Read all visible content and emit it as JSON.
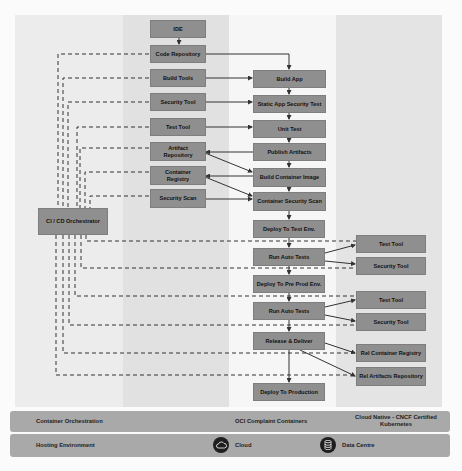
{
  "diagram": {
    "tools_column": [
      {
        "id": "ide",
        "label": "IDE"
      },
      {
        "id": "code-repository",
        "label": "Code Repository"
      },
      {
        "id": "build-tools",
        "label": "Build Tools"
      },
      {
        "id": "security-tool",
        "label": "Security Tool"
      },
      {
        "id": "test-tool",
        "label": "Test Tool"
      },
      {
        "id": "artifact-repository",
        "label": "Artifact Repository"
      },
      {
        "id": "container-registry",
        "label": "Container Registry"
      },
      {
        "id": "security-scan",
        "label": "Security Scan"
      }
    ],
    "orchestrator": {
      "label": "CI / CD Orchestrator"
    },
    "pipeline_steps": [
      {
        "id": "build-app",
        "label": "Build App"
      },
      {
        "id": "static-app-security-test",
        "label": "Static App Security Test"
      },
      {
        "id": "unit-test",
        "label": "Unit Test"
      },
      {
        "id": "publish-artifacts",
        "label": "Publish Artifacts"
      },
      {
        "id": "build-container-image",
        "label": "Build Container Image"
      },
      {
        "id": "container-security-scan",
        "label": "Container Security Scan"
      },
      {
        "id": "deploy-to-test-env",
        "label": "Deploy To Test Env."
      },
      {
        "id": "run-auto-tests-1",
        "label": "Run Auto  Tests"
      },
      {
        "id": "deploy-to-pre-prod-env",
        "label": "Deploy To Pre Prod Env."
      },
      {
        "id": "run-auto-tests-2",
        "label": "Run Auto Tests"
      },
      {
        "id": "release-deliver",
        "label": "Release & Deliver"
      },
      {
        "id": "deploy-to-production",
        "label": "Deploy To Production"
      }
    ],
    "environment_tools": [
      {
        "id": "test-tool-1",
        "label": "Test Tool"
      },
      {
        "id": "security-tool-1",
        "label": "Security Tool"
      },
      {
        "id": "test-tool-2",
        "label": "Test Tool"
      },
      {
        "id": "security-tool-2",
        "label": "Security Tool"
      },
      {
        "id": "rel-container-registry",
        "label": "Rel Container Registry"
      },
      {
        "id": "rel-artifacts-repository",
        "label": "Rel Artifacts Repository"
      }
    ],
    "platform_bar": {
      "label": "Container Orchestration",
      "middle": "OCI Complaint Containers",
      "right": "Cloud Native - CNCF Certified Kubernetes"
    },
    "hosting_bar": {
      "label": "Hosting Environment",
      "cloud": {
        "icon": "cloud-icon",
        "label": "Cloud"
      },
      "datacentre": {
        "icon": "database-icon",
        "label": "Data Centre"
      }
    },
    "colors": {
      "box_fill": "#8f8f8f",
      "bar_fill": "#a9a9a9",
      "line": "#333333",
      "icon_bg": "#1e1e1e"
    }
  }
}
